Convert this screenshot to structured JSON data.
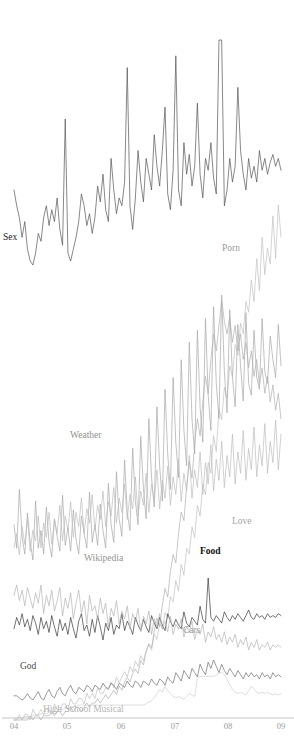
{
  "chart_data": {
    "type": "line",
    "title": "",
    "subtitle": "",
    "xlabel": "",
    "ylabel": "",
    "grid": false,
    "legend_position": "inline-annotations",
    "axis": {
      "x_tick_labels": [
        "04",
        "05",
        "06",
        "07",
        "08",
        "09"
      ],
      "x_tick_positions": [
        14,
        67,
        121,
        175,
        228,
        281
      ],
      "x_range": [
        "2004",
        "2009"
      ],
      "baseline_y": 718,
      "axis_color": "#b9b9b9",
      "tick_label_color": "#9a9a9a"
    },
    "background_color": "#ffffff",
    "series": [
      {
        "name": "Sex",
        "label": "Sex",
        "color": "#555555",
        "label_color": "#222222",
        "bold_label": false,
        "label_x": 3,
        "label_y": 240,
        "band_top": 40,
        "band_bottom": 265,
        "values": [
          62,
          58,
          55,
          50,
          54,
          47,
          44,
          43,
          46,
          51,
          49,
          55,
          58,
          53,
          57,
          54,
          60,
          52,
          48,
          80,
          46,
          44,
          47,
          50,
          54,
          61,
          58,
          53,
          56,
          51,
          55,
          63,
          59,
          66,
          57,
          54,
          70,
          62,
          56,
          60,
          58,
          64,
          93,
          58,
          52,
          60,
          72,
          64,
          59,
          70,
          66,
          62,
          76,
          68,
          63,
          72,
          83,
          61,
          57,
          67,
          96,
          62,
          58,
          74,
          66,
          71,
          63,
          68,
          84,
          66,
          60,
          70,
          67,
          74,
          65,
          61,
          100,
          100,
          58,
          62,
          70,
          64,
          68,
          88,
          72,
          66,
          62,
          70,
          65,
          68,
          64,
          72,
          67,
          70,
          66,
          69,
          71,
          68,
          70,
          67
        ]
      },
      {
        "name": "Porn",
        "label": "Porn",
        "color": "#c2c2c2",
        "label_color": "#9a9a9a",
        "bold_label": false,
        "label_x": 222,
        "label_y": 251,
        "band_top": 205,
        "band_bottom": 720,
        "values": [
          2,
          2,
          3,
          2,
          3,
          3,
          2,
          4,
          3,
          3,
          4,
          3,
          4,
          4,
          3,
          5,
          4,
          4,
          5,
          5,
          4,
          6,
          5,
          5,
          6,
          6,
          5,
          7,
          6,
          7,
          6,
          8,
          7,
          7,
          8,
          8,
          9,
          8,
          10,
          9,
          10,
          11,
          10,
          12,
          11,
          13,
          12,
          14,
          13,
          15,
          16,
          15,
          18,
          17,
          20,
          19,
          22,
          21,
          25,
          24,
          28,
          26,
          31,
          29,
          34,
          33,
          38,
          36,
          42,
          40,
          46,
          44,
          50,
          48,
          55,
          52,
          60,
          58,
          64,
          62,
          68,
          66,
          72,
          70,
          76,
          74,
          80,
          78,
          84,
          80,
          88,
          82,
          92,
          85,
          90,
          87,
          96,
          88,
          98,
          92
        ]
      },
      {
        "name": "Weather",
        "label": "Weather",
        "color": "#a8a8a8",
        "label_color": "#8f8f8f",
        "bold_label": false,
        "label_x": 70,
        "label_y": 438,
        "band_top": 295,
        "band_bottom": 560,
        "values": [
          22,
          14,
          34,
          18,
          12,
          26,
          16,
          10,
          30,
          14,
          20,
          12,
          28,
          16,
          11,
          24,
          18,
          13,
          32,
          15,
          21,
          13,
          27,
          17,
          12,
          25,
          19,
          14,
          33,
          16,
          22,
          15,
          29,
          20,
          14,
          36,
          22,
          16,
          40,
          24,
          18,
          44,
          26,
          20,
          48,
          30,
          22,
          52,
          34,
          24,
          58,
          38,
          28,
          62,
          42,
          30,
          68,
          46,
          34,
          72,
          50,
          38,
          78,
          54,
          42,
          84,
          58,
          46,
          88,
          62,
          50,
          92,
          66,
          54,
          96,
          70,
          58,
          100,
          74,
          60,
          95,
          72,
          62,
          90,
          76,
          64,
          94,
          70,
          66,
          88,
          72,
          68,
          92,
          74,
          70,
          86,
          78,
          72,
          90,
          76
        ]
      },
      {
        "name": "Love",
        "label": "Love",
        "color": "#bdbdbd",
        "label_color": "#a5a5a5",
        "bold_label": false,
        "label_x": 232,
        "label_y": 524,
        "band_top": 420,
        "band_bottom": 555,
        "values": [
          18,
          22,
          16,
          24,
          19,
          26,
          17,
          23,
          20,
          27,
          18,
          25,
          21,
          28,
          19,
          26,
          22,
          30,
          20,
          27,
          23,
          31,
          21,
          28,
          24,
          32,
          22,
          29,
          25,
          33,
          23,
          30,
          26,
          34,
          24,
          31,
          27,
          35,
          25,
          32,
          28,
          36,
          26,
          33,
          29,
          38,
          27,
          34,
          30,
          39,
          28,
          36,
          31,
          40,
          29,
          37,
          32,
          41,
          30,
          38,
          33,
          43,
          31,
          39,
          34,
          44,
          32,
          40,
          35,
          45,
          33,
          42,
          36,
          47,
          34,
          43,
          37,
          48,
          35,
          44,
          38,
          50,
          36,
          45,
          39,
          51,
          37,
          46,
          40,
          52,
          38,
          47,
          41,
          53,
          39,
          48,
          42,
          54,
          40,
          50
        ]
      },
      {
        "name": "Wikipedia",
        "label": "Wikipedia",
        "color": "#b0b0b0",
        "label_color": "#959595",
        "bold_label": false,
        "label_x": 84,
        "label_y": 561,
        "band_top": 300,
        "band_bottom": 720,
        "values": [
          1,
          1,
          1,
          1,
          1,
          1,
          2,
          1,
          2,
          2,
          1,
          2,
          2,
          2,
          3,
          2,
          3,
          3,
          2,
          3,
          3,
          4,
          3,
          4,
          4,
          3,
          4,
          5,
          4,
          5,
          5,
          6,
          5,
          6,
          7,
          6,
          7,
          8,
          7,
          9,
          8,
          10,
          11,
          10,
          12,
          13,
          12,
          15,
          14,
          17,
          19,
          18,
          22,
          25,
          23,
          28,
          32,
          30,
          36,
          40,
          38,
          45,
          50,
          48,
          56,
          62,
          58,
          66,
          72,
          68,
          76,
          82,
          78,
          86,
          92,
          88,
          94,
          100,
          95,
          92,
          96,
          90,
          94,
          88,
          92,
          86,
          90,
          84,
          88,
          82,
          86,
          80,
          84,
          78,
          82,
          76,
          80,
          74,
          78,
          72
        ]
      },
      {
        "name": "Food",
        "label": "Food",
        "color": "#3a3a3a",
        "label_color": "#111111",
        "bold_label": true,
        "label_x": 200,
        "label_y": 554,
        "band_top": 578,
        "band_bottom": 640,
        "values": [
          46,
          58,
          50,
          62,
          48,
          56,
          44,
          60,
          52,
          40,
          58,
          46,
          54,
          42,
          60,
          48,
          38,
          56,
          44,
          52,
          40,
          58,
          46,
          36,
          54,
          62,
          44,
          50,
          38,
          56,
          42,
          60,
          48,
          34,
          52,
          44,
          58,
          40,
          50,
          46,
          62,
          44,
          54,
          48,
          40,
          58,
          50,
          44,
          56,
          48,
          42,
          60,
          52,
          46,
          58,
          50,
          44,
          62,
          54,
          48,
          56,
          50,
          46,
          64,
          52,
          48,
          58,
          54,
          50,
          70,
          56,
          52,
          100,
          58,
          54,
          60,
          56,
          52,
          64,
          58,
          54,
          60,
          56,
          62,
          58,
          54,
          60,
          66,
          58,
          56,
          62,
          58,
          60,
          56,
          62,
          58,
          60,
          58,
          62,
          60
        ]
      },
      {
        "name": "Cars",
        "label": "Cars",
        "color": "#b4b4b4",
        "label_color": "#9b9b9b",
        "bold_label": false,
        "label_x": 183,
        "label_y": 633,
        "band_top": 585,
        "band_bottom": 650,
        "values": [
          52,
          60,
          48,
          56,
          44,
          58,
          50,
          42,
          54,
          46,
          60,
          38,
          52,
          44,
          56,
          40,
          48,
          58,
          36,
          50,
          42,
          54,
          34,
          46,
          56,
          38,
          48,
          30,
          52,
          40,
          44,
          34,
          50,
          38,
          46,
          28,
          42,
          36,
          48,
          30,
          40,
          34,
          44,
          26,
          38,
          32,
          42,
          24,
          36,
          30,
          40,
          22,
          34,
          28,
          38,
          26,
          32,
          24,
          36,
          22,
          30,
          26,
          34,
          20,
          28,
          24,
          32,
          18,
          26,
          22,
          30,
          16,
          24,
          20,
          28,
          18,
          22,
          16,
          24,
          14,
          20,
          16,
          22,
          12,
          18,
          14,
          20,
          10,
          16,
          12,
          18,
          10,
          14,
          12,
          16,
          10,
          14,
          12,
          14,
          12
        ]
      },
      {
        "name": "God",
        "label": "God",
        "color": "#6e6e6e",
        "label_color": "#4a4a4a",
        "bold_label": false,
        "label_x": 20,
        "label_y": 669,
        "band_top": 660,
        "band_bottom": 700,
        "values": [
          40,
          40,
          38,
          36,
          38,
          42,
          38,
          36,
          40,
          44,
          38,
          36,
          42,
          46,
          40,
          38,
          44,
          48,
          42,
          40,
          46,
          50,
          44,
          42,
          48,
          46,
          44,
          50,
          48,
          44,
          50,
          48,
          46,
          52,
          48,
          46,
          52,
          50,
          46,
          52,
          50,
          48,
          54,
          50,
          48,
          54,
          52,
          48,
          54,
          52,
          50,
          56,
          52,
          50,
          56,
          54,
          50,
          58,
          54,
          52,
          62,
          58,
          54,
          64,
          60,
          56,
          66,
          62,
          58,
          70,
          64,
          60,
          72,
          66,
          74,
          68,
          62,
          70,
          64,
          60,
          66,
          62,
          58,
          64,
          60,
          56,
          62,
          58,
          62,
          58,
          60,
          56,
          62,
          58,
          60,
          56,
          62,
          58,
          60,
          58
        ]
      },
      {
        "name": "High School Musical",
        "label": "High School Musical",
        "color": "#cecece",
        "label_color": "#b5b5b5",
        "bold_label": false,
        "label_x": 43,
        "label_y": 712,
        "band_top": 672,
        "band_bottom": 718,
        "values": [
          0,
          0,
          0,
          0,
          2,
          2,
          2,
          4,
          4,
          4,
          6,
          6,
          6,
          8,
          8,
          10,
          10,
          12,
          12,
          14,
          14,
          16,
          16,
          16,
          18,
          18,
          18,
          18,
          18,
          18,
          18,
          18,
          18,
          18,
          18,
          18,
          18,
          18,
          18,
          18,
          18,
          18,
          18,
          18,
          18,
          18,
          18,
          18,
          18,
          20,
          22,
          24,
          28,
          34,
          40,
          36,
          44,
          38,
          34,
          30,
          28,
          30,
          28,
          26,
          30,
          34,
          32,
          30,
          56,
          58,
          58,
          58,
          58,
          58,
          58,
          60,
          62,
          64,
          60,
          54,
          46,
          40,
          36,
          34,
          36,
          34,
          32,
          38,
          44,
          40,
          36,
          34,
          36,
          34,
          36,
          34,
          32,
          34,
          32,
          34
        ]
      }
    ]
  }
}
